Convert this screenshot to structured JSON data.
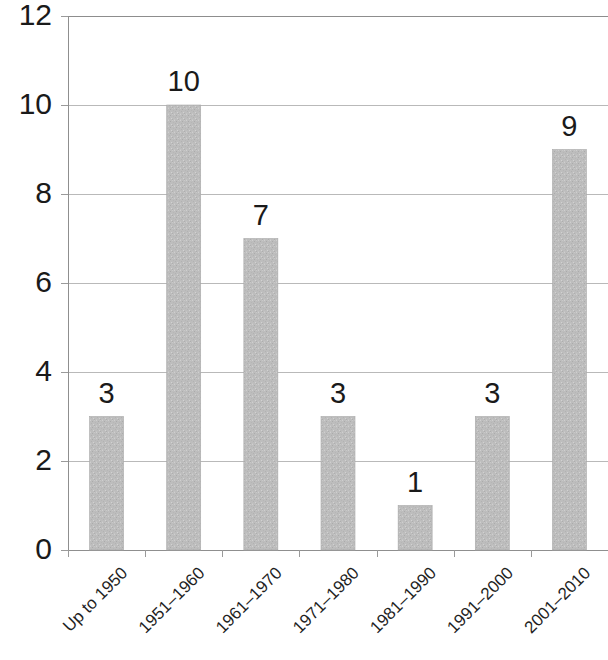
{
  "chart_data": {
    "type": "bar",
    "title": "",
    "subtitle": "",
    "xlabel": "",
    "ylabel": "",
    "categories": [
      "Up to 1950",
      "1951–1960",
      "1961–1970",
      "1971–1980",
      "1981–1990",
      "1991–2000",
      "2001–2010"
    ],
    "values": [
      3,
      10,
      7,
      3,
      1,
      3,
      9
    ],
    "data_labels": [
      "3",
      "10",
      "7",
      "3",
      "1",
      "3",
      "9"
    ],
    "ylim": [
      0,
      12
    ],
    "ytick_values": [
      0,
      2,
      4,
      6,
      8,
      10,
      12
    ],
    "ytick_labels": [
      "0",
      "2",
      "4",
      "6",
      "8",
      "10",
      "12"
    ],
    "grid": "horizontal",
    "legend": "none",
    "bar_color": "#bdbdbd",
    "bar_edge_color": "#a9a9a9",
    "background_color": "#ffffff",
    "text_color": "#1a1a1a",
    "gridline_color": "#b9b9b9",
    "axis_color": "#8f8f8f",
    "xtick_label_rotation": 45
  },
  "axes": {
    "y_axis_name": "y-axis",
    "x_axis_name": "x-axis"
  }
}
